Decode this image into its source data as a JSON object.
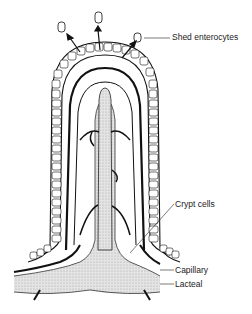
{
  "diagram": {
    "labels": {
      "shed_enterocytes": "Shed enterocytes",
      "crypt_cells": "Crypt cells",
      "capillary": "Capillary",
      "lacteal": "Lacteal"
    },
    "colors": {
      "ink": "#111111",
      "lacteal_fill": "#d8d8d8",
      "background": "#ffffff"
    }
  }
}
